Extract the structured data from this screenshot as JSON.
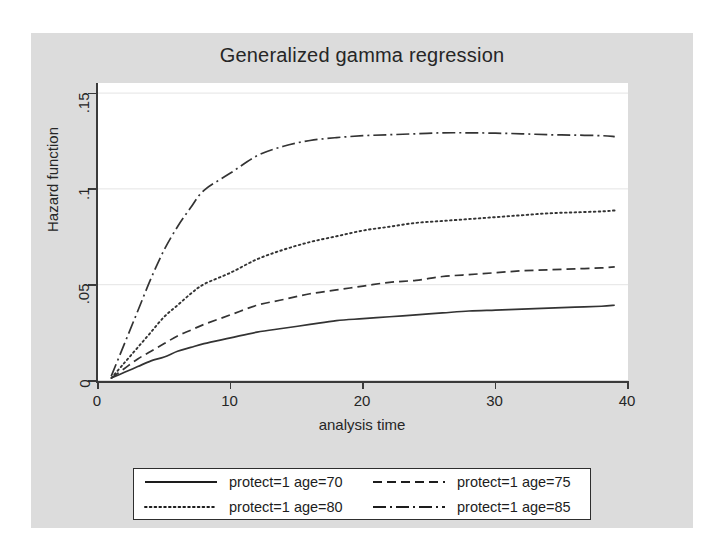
{
  "chart_data": {
    "type": "line",
    "title": "Generalized gamma regression",
    "xlabel": "analysis time",
    "ylabel": "Hazard function",
    "xlim": [
      0,
      40
    ],
    "ylim": [
      0,
      0.155
    ],
    "xticks": [
      0,
      10,
      20,
      30,
      40
    ],
    "xtick_labels": [
      "0",
      "10",
      "20",
      "30",
      "40"
    ],
    "yticks": [
      0,
      0.05,
      0.1,
      0.15
    ],
    "ytick_labels": [
      "0",
      ".05",
      ".1",
      ".15"
    ],
    "grid": "horizontal",
    "legend_position": "below",
    "series": [
      {
        "name": "protect=1 age=70",
        "dash": "solid",
        "x": [
          1,
          2,
          3,
          4,
          5,
          6,
          7,
          8,
          10,
          12,
          14,
          16,
          18,
          20,
          22,
          24,
          26,
          28,
          30,
          32,
          34,
          36,
          38,
          39
        ],
        "y": [
          0.001,
          0.004,
          0.007,
          0.01,
          0.012,
          0.015,
          0.017,
          0.019,
          0.022,
          0.025,
          0.027,
          0.029,
          0.031,
          0.032,
          0.033,
          0.034,
          0.035,
          0.036,
          0.0365,
          0.037,
          0.0375,
          0.038,
          0.0385,
          0.039
        ]
      },
      {
        "name": "protect=1 age=75",
        "dash": "dashed",
        "x": [
          1,
          2,
          3,
          4,
          5,
          6,
          7,
          8,
          10,
          12,
          14,
          16,
          18,
          20,
          22,
          24,
          26,
          28,
          30,
          32,
          34,
          36,
          38,
          39
        ],
        "y": [
          0.001,
          0.006,
          0.011,
          0.015,
          0.019,
          0.023,
          0.026,
          0.029,
          0.034,
          0.039,
          0.042,
          0.045,
          0.047,
          0.049,
          0.051,
          0.052,
          0.054,
          0.055,
          0.056,
          0.057,
          0.0575,
          0.058,
          0.0585,
          0.059
        ]
      },
      {
        "name": "protect=1 age=80",
        "dash": "dotted",
        "x": [
          1,
          2,
          3,
          4,
          5,
          6,
          7,
          8,
          10,
          12,
          14,
          16,
          18,
          20,
          22,
          24,
          26,
          28,
          30,
          32,
          34,
          36,
          38,
          39
        ],
        "y": [
          0.001,
          0.009,
          0.017,
          0.025,
          0.033,
          0.039,
          0.045,
          0.05,
          0.056,
          0.063,
          0.068,
          0.072,
          0.075,
          0.078,
          0.08,
          0.082,
          0.083,
          0.084,
          0.085,
          0.086,
          0.087,
          0.0875,
          0.088,
          0.0885
        ]
      },
      {
        "name": "protect=1 age=85",
        "dash": "dashdot",
        "x": [
          1,
          2,
          3,
          4,
          5,
          6,
          7,
          8,
          10,
          12,
          14,
          16,
          18,
          20,
          22,
          24,
          26,
          28,
          30,
          32,
          34,
          36,
          38,
          39
        ],
        "y": [
          0.002,
          0.019,
          0.036,
          0.053,
          0.068,
          0.08,
          0.09,
          0.099,
          0.108,
          0.117,
          0.122,
          0.125,
          0.1265,
          0.1275,
          0.128,
          0.1285,
          0.129,
          0.129,
          0.1288,
          0.1285,
          0.128,
          0.1278,
          0.1275,
          0.127
        ]
      }
    ]
  },
  "legend": {
    "items": [
      {
        "label": "protect=1 age=70"
      },
      {
        "label": "protect=1 age=75"
      },
      {
        "label": "protect=1 age=80"
      },
      {
        "label": "protect=1 age=85"
      }
    ]
  }
}
